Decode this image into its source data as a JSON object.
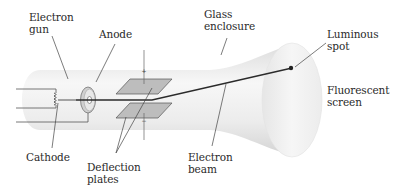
{
  "diagram": {
    "type": "cathode-ray-tube",
    "labels": {
      "electron_gun": "Electron\ngun",
      "anode": "Anode",
      "glass_enclosure": "Glass\nenclosure",
      "luminous_spot": "Luminous\nspot",
      "fluorescent_screen": "Fluorescent\nscreen",
      "cathode": "Cathode",
      "deflection_plates": "Deflection\nplates",
      "electron_beam": "Electron\nbeam"
    },
    "polarity": {
      "top_plate": "+",
      "bottom_plate": "−"
    },
    "colors": {
      "tube_light": "#f4f4f4",
      "tube_shadow": "#d9d9d9",
      "plate_fill": "#b8b8b8",
      "line": "#333333",
      "spot": "#222222",
      "text": "#2a2a2a"
    }
  }
}
